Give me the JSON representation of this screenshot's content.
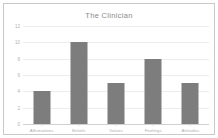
{
  "chart_data": {
    "type": "bar",
    "title": "The Clinician",
    "xlabel": "",
    "ylabel": "",
    "categories": [
      "Affirmations",
      "Beliefs",
      "Values",
      "Feelings",
      "Attitudes"
    ],
    "values": [
      4,
      10,
      5,
      8,
      5
    ],
    "ylim": [
      0,
      12
    ],
    "yticks": [
      0,
      2,
      4,
      6,
      8,
      10,
      12
    ],
    "ytick_labels": [
      "0",
      "2",
      "4",
      "6",
      "8",
      "10",
      "12"
    ],
    "grid": true,
    "legend": false,
    "bar_color": "#7d7d7d",
    "plot_background": "#ffffff",
    "frame_color": "#c9c9c9",
    "grid_color": "#ededed",
    "title_color": "#8a8a8a",
    "tick_color": "#b3b3b3"
  }
}
